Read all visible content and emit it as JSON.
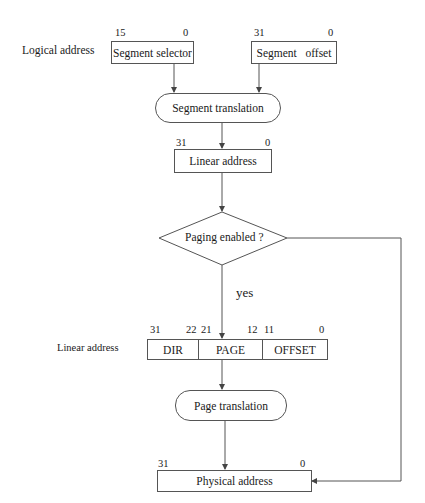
{
  "diagram": {
    "type": "flowchart",
    "logical_address": {
      "label": "Logical address",
      "segment_selector": {
        "label": "Segment selector",
        "bit_high": "15",
        "bit_low": "0"
      },
      "segment_offset": {
        "label": "Segment   offset",
        "bit_high": "31",
        "bit_low": "0"
      }
    },
    "segment_translation": {
      "label": "Segment translation"
    },
    "linear_address_box": {
      "label": "Linear address",
      "bit_high": "31",
      "bit_low": "0"
    },
    "decision": {
      "label": "Paging enabled ?",
      "yes_label": "yes"
    },
    "linear_address_split": {
      "label": "Linear address",
      "fields": [
        {
          "name": "DIR",
          "bit_high": "31",
          "bit_low": "22"
        },
        {
          "name": "PAGE",
          "bit_high": "21",
          "bit_low": "12"
        },
        {
          "name": "OFFSET",
          "bit_high": "11",
          "bit_low": "0"
        }
      ]
    },
    "page_translation": {
      "label": "Page translation"
    },
    "physical_address": {
      "label": "Physical address",
      "bit_high": "31",
      "bit_low": "0"
    },
    "colors": {
      "line": "#555555",
      "text": "#1a1a1a",
      "background": "#ffffff"
    }
  }
}
